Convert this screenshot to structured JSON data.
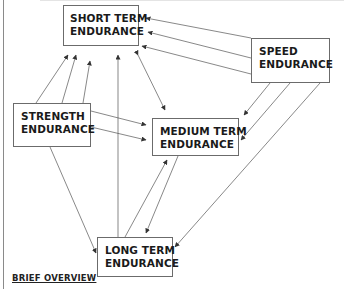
{
  "diagram": {
    "nodes": [
      {
        "id": "short",
        "line1": "SHORT TERM",
        "line2": "ENDURANCE"
      },
      {
        "id": "speed",
        "line1": "SPEED",
        "line2": "ENDURANCE"
      },
      {
        "id": "strength",
        "line1": "STRENGTH",
        "line2": "ENDURANCE"
      },
      {
        "id": "medium",
        "line1": "MEDIUM TERM",
        "line2": "ENDURANCE"
      },
      {
        "id": "long",
        "line1": "LONG TERM",
        "line2": "ENDURANCE"
      }
    ],
    "edges": [
      {
        "from": "speed",
        "to": "short",
        "count": 3
      },
      {
        "from": "strength",
        "to": "short",
        "count": 3
      },
      {
        "from": "short",
        "to": "medium",
        "direction": "both"
      },
      {
        "from": "long",
        "to": "short",
        "count": 1
      },
      {
        "from": "strength",
        "to": "medium",
        "count": 2
      },
      {
        "from": "speed",
        "to": "medium",
        "count": 2
      },
      {
        "from": "strength",
        "to": "long",
        "count": 1
      },
      {
        "from": "speed",
        "to": "long",
        "count": 1
      },
      {
        "from": "long",
        "to": "medium",
        "direction": "both"
      }
    ],
    "caption": "BRIEF OVERVIEW"
  },
  "colors": {
    "line": "#555555",
    "box_border": "#6b6b6b",
    "text": "#1a1a1a"
  }
}
